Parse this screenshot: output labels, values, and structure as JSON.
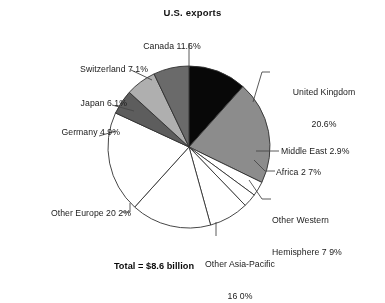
{
  "chart_data": {
    "type": "pie",
    "title": "U.S. exports",
    "total_note": "Total = $8.6 billion",
    "total_value": 8.6,
    "total_units": "billion USD",
    "units": "percent",
    "start_angle_deg": 0,
    "direction": "clockwise",
    "legend": "none",
    "grid": false,
    "categories": [
      "Canada",
      "United Kingdom",
      "Middle East",
      "Africa",
      "Other Western Hemisphere",
      "Other Asia-Pacific",
      "Other Europe",
      "Germany",
      "Japan",
      "Switzerland"
    ],
    "values": [
      11.6,
      20.6,
      2.9,
      2.7,
      7.9,
      16.0,
      20.2,
      4.9,
      6.1,
      7.1
    ],
    "slices": [
      {
        "label": "Canada",
        "value": 11.6,
        "display": "11.6%",
        "color": "#0d0d0d"
      },
      {
        "label": "United Kingdom",
        "value": 20.6,
        "display": "20.6%",
        "color": "#8c8c8c"
      },
      {
        "label": "Middle East",
        "value": 2.9,
        "display": "2.9%",
        "color": "#ffffff"
      },
      {
        "label": "Africa",
        "value": 2.7,
        "display": "2 7%",
        "color": "#ffffff"
      },
      {
        "label": "Other Western Hemisphere",
        "value": 7.9,
        "display": "7 9%",
        "color": "#ffffff"
      },
      {
        "label": "Other Asia-Pacific",
        "value": 16.0,
        "display": "16 0%",
        "color": "#ffffff"
      },
      {
        "label": "Other Europe",
        "value": 20.2,
        "display": "20 2%",
        "color": "#ffffff"
      },
      {
        "label": "Germany",
        "value": 4.9,
        "display": "4 9%",
        "color": "#5e5e5e"
      },
      {
        "label": "Japan",
        "value": 6.1,
        "display": "6 1%",
        "color": "#adadad"
      },
      {
        "label": "Switzerland",
        "value": 7.1,
        "display": "7.1%",
        "color": "#6b6b6b"
      }
    ]
  },
  "labels": {
    "canada": "Canada 11.6%",
    "switzerland": "Switzerland 7.1%",
    "japan": "Japan 6 1%",
    "germany": "Germany 4 9%",
    "united_kingdom_line1": "United Kingdom",
    "united_kingdom_line2": "20.6%",
    "middle_east": "Middle East 2.9%",
    "africa": "Africa 2 7%",
    "other_western_line1": "Other Western",
    "other_western_line2": "Hemisphere 7 9%",
    "other_asia_line1": "Other Asia-Pacific",
    "other_asia_line2": "16 0%",
    "other_europe": "Other Europe 20 2%",
    "total": "Total = $8.6 billion"
  },
  "colors": {
    "background": "#ffffff",
    "outline": "#333333",
    "text": "#1f1f1f",
    "leader_line": "#4a4a4a"
  }
}
